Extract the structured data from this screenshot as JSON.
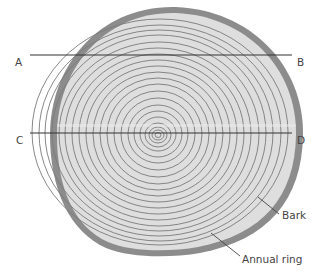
{
  "diagram": {
    "labels": {
      "A": "A",
      "B": "B",
      "C": "C",
      "D": "D",
      "bark": "Bark",
      "annual_ring": "Annual ring"
    },
    "colors": {
      "bark": "#8c8c8c",
      "wood": "#dedede",
      "ring": "#7a7a7a",
      "cut_line": "#333333",
      "label_text": "#444444"
    },
    "cut_lines": [
      {
        "from": "A",
        "to": "B"
      },
      {
        "from": "C",
        "to": "D"
      }
    ]
  }
}
